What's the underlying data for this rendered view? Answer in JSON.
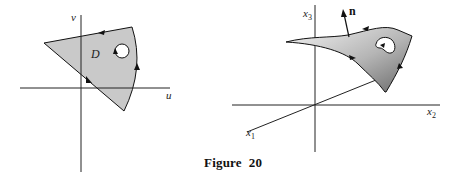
{
  "figure": {
    "caption": "Figure  20",
    "left_panel": {
      "description": "Planar region D in the (u,v) parameter plane with a circular hole; boundary oriented counterclockwise, hole boundary clockwise",
      "axis_labels": {
        "horizontal": "u",
        "vertical": "v"
      },
      "region_label": "D",
      "fill_color": "#c8c8c8"
    },
    "right_panel": {
      "description": "Surface in 3D space (x1, x2, x3) with hole, boundary orientation arrows and unit normal n",
      "axis_labels": {
        "x1": "x",
        "x1_sub": "1",
        "x2": "x",
        "x2_sub": "2",
        "x3": "x",
        "x3_sub": "3"
      },
      "normal_label": "n",
      "fill_gradient": [
        "#f2f2f2",
        "#6e6e6e"
      ]
    }
  }
}
